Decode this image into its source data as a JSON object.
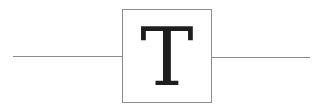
{
  "ornament": {
    "letter": "T",
    "colors": {
      "rule": "#8a8a8a",
      "border": "#8c8c8c",
      "letter": "#1e1e1e"
    }
  }
}
